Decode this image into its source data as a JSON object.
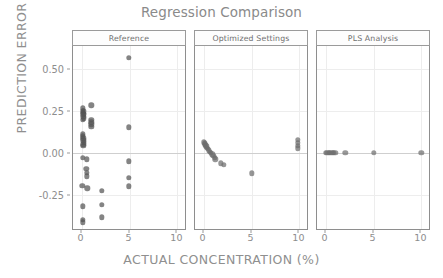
{
  "chart_data": {
    "type": "scatter",
    "title": "Regression Comparison",
    "xlabel": "ACTUAL CONCENTRATION (%)",
    "ylabel": "PREDICTION ERROR",
    "xlim": [
      -0.9,
      11.0
    ],
    "ylim": [
      -0.46,
      0.635
    ],
    "xticks": [
      0,
      5,
      10
    ],
    "xtick_labels": [
      "0",
      "5",
      "10"
    ],
    "yticks": [
      0.5,
      0.25,
      0.0,
      -0.25
    ],
    "ytick_labels": [
      "0.50",
      "0.25",
      "0.00",
      "-0.25"
    ],
    "grid": true,
    "zero_line": 0.0,
    "legend": "none",
    "facet_layout": "1x3",
    "panels": [
      {
        "label": "Reference",
        "point_color": "#555555",
        "point_size": 5.4,
        "points": [
          {
            "x": 0.1,
            "y": 0.265
          },
          {
            "x": 0.12,
            "y": 0.25
          },
          {
            "x": 0.14,
            "y": 0.238
          },
          {
            "x": 0.16,
            "y": 0.228
          },
          {
            "x": 0.18,
            "y": 0.215
          },
          {
            "x": 0.2,
            "y": 0.205
          },
          {
            "x": 0.22,
            "y": 0.247
          },
          {
            "x": 0.24,
            "y": 0.232
          },
          {
            "x": 0.15,
            "y": 0.196
          },
          {
            "x": 0.13,
            "y": 0.11
          },
          {
            "x": 0.15,
            "y": 0.098
          },
          {
            "x": 0.17,
            "y": 0.086
          },
          {
            "x": 0.19,
            "y": 0.074
          },
          {
            "x": 0.21,
            "y": 0.062
          },
          {
            "x": 0.16,
            "y": 0.05
          },
          {
            "x": 0.18,
            "y": 0.042
          },
          {
            "x": 1.0,
            "y": 0.282
          },
          {
            "x": 1.0,
            "y": 0.196
          },
          {
            "x": 1.02,
            "y": 0.182
          },
          {
            "x": 1.0,
            "y": 0.168
          },
          {
            "x": 1.02,
            "y": 0.155
          },
          {
            "x": 0.1,
            "y": -0.03
          },
          {
            "x": 0.55,
            "y": -0.04
          },
          {
            "x": 0.5,
            "y": -0.095
          },
          {
            "x": 0.52,
            "y": -0.118
          },
          {
            "x": 0.52,
            "y": -0.14
          },
          {
            "x": 0.08,
            "y": -0.196
          },
          {
            "x": 0.58,
            "y": -0.212
          },
          {
            "x": 0.1,
            "y": -0.318
          },
          {
            "x": 0.1,
            "y": -0.4
          },
          {
            "x": 0.12,
            "y": -0.415
          },
          {
            "x": 2.1,
            "y": -0.228
          },
          {
            "x": 2.1,
            "y": -0.31
          },
          {
            "x": 2.1,
            "y": -0.385
          },
          {
            "x": 4.9,
            "y": 0.565
          },
          {
            "x": 4.95,
            "y": 0.152
          },
          {
            "x": 4.92,
            "y": -0.052
          },
          {
            "x": 4.95,
            "y": -0.148
          },
          {
            "x": 4.95,
            "y": -0.2
          }
        ]
      },
      {
        "label": "Optimized Settings",
        "point_color": "#6e6e6e",
        "point_size": 5.4,
        "points": [
          {
            "x": 0.05,
            "y": 0.062
          },
          {
            "x": 0.1,
            "y": 0.056
          },
          {
            "x": 0.15,
            "y": 0.05
          },
          {
            "x": 0.2,
            "y": 0.044
          },
          {
            "x": 0.28,
            "y": 0.038
          },
          {
            "x": 0.36,
            "y": 0.03
          },
          {
            "x": 0.45,
            "y": 0.022
          },
          {
            "x": 0.55,
            "y": 0.014
          },
          {
            "x": 0.66,
            "y": 0.006
          },
          {
            "x": 0.78,
            "y": -0.002
          },
          {
            "x": 0.9,
            "y": -0.01
          },
          {
            "x": 1.02,
            "y": -0.018
          },
          {
            "x": 1.14,
            "y": -0.03
          },
          {
            "x": 1.22,
            "y": -0.04
          },
          {
            "x": 1.8,
            "y": -0.062
          },
          {
            "x": 2.1,
            "y": -0.072
          },
          {
            "x": 5.0,
            "y": -0.122
          },
          {
            "x": 9.8,
            "y": 0.075
          },
          {
            "x": 9.82,
            "y": 0.058
          },
          {
            "x": 9.8,
            "y": 0.04
          },
          {
            "x": 9.82,
            "y": 0.026
          }
        ]
      },
      {
        "label": "PLS Analysis",
        "point_color": "#707070",
        "point_size": 5.4,
        "points": [
          {
            "x": 0.05,
            "y": 0.0
          },
          {
            "x": 0.18,
            "y": 0.0
          },
          {
            "x": 0.32,
            "y": 0.0
          },
          {
            "x": 0.46,
            "y": 0.0
          },
          {
            "x": 0.6,
            "y": 0.0
          },
          {
            "x": 0.74,
            "y": 0.0
          },
          {
            "x": 0.88,
            "y": 0.0
          },
          {
            "x": 1.02,
            "y": 0.0
          },
          {
            "x": 2.05,
            "y": 0.0
          },
          {
            "x": 5.0,
            "y": 0.0
          },
          {
            "x": 10.0,
            "y": 0.0
          }
        ]
      }
    ]
  }
}
